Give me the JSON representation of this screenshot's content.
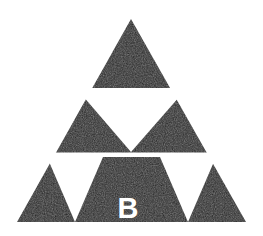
{
  "figure": {
    "type": "fractal-diagram",
    "iteration_order": 2,
    "canvas": {
      "width": 263,
      "height": 236
    },
    "colors": {
      "background": "#ffffff",
      "fill": "#1a1a1a",
      "hole": "#ffffff",
      "label": "#ffffff"
    },
    "outer_triangle": {
      "apex": {
        "x": 131,
        "y": 19
      },
      "bottom_left": {
        "x": 17,
        "y": 222
      },
      "bottom_right": {
        "x": 246,
        "y": 222
      },
      "path": "M131,19 L246,222 L17,222 Z"
    },
    "holes": [
      {
        "name": "center-hole-level-1",
        "left": {
          "x": 76,
          "y": 88
        },
        "right": {
          "x": 187,
          "y": 88
        },
        "bottom": {
          "x": 131,
          "y": 152
        },
        "path": "M76,88 L187,88 L131,152 Z"
      },
      {
        "name": "bottom-left-hole-level-2",
        "left": {
          "x": 47,
          "y": 157
        },
        "right": {
          "x": 103,
          "y": 157
        },
        "bottom": {
          "x": 75,
          "y": 222
        },
        "path": "M47,157 L103,157 L75,222 Z"
      },
      {
        "name": "bottom-right-hole-level-2",
        "left": {
          "x": 160,
          "y": 157
        },
        "right": {
          "x": 216,
          "y": 157
        },
        "bottom": {
          "x": 188,
          "y": 222
        },
        "path": "M160,157 L216,157 L188,222 Z"
      }
    ],
    "gaps": [
      {
        "name": "mid-horizontal-gap",
        "x": 47,
        "y": 152.5,
        "width": 169,
        "height": 4.5
      }
    ],
    "labels": [
      {
        "name": "label-b",
        "text": "B",
        "x": 128,
        "y": 218,
        "font_size": 29,
        "color": "#ffffff",
        "region": "bottom-center-subtriangle"
      }
    ]
  }
}
